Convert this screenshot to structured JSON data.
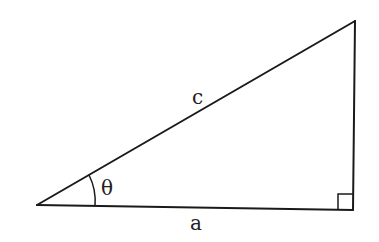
{
  "diagram": {
    "type": "right-triangle",
    "vertices": {
      "left": [
        37,
        205
      ],
      "top_right": [
        355,
        21
      ],
      "bottom_right": [
        353,
        210
      ]
    },
    "labels": {
      "hypotenuse": "c",
      "base": "a",
      "angle": "θ"
    },
    "right_angle_marker": true,
    "stroke_color": "#1a1a1a",
    "label_color": "#222222"
  }
}
